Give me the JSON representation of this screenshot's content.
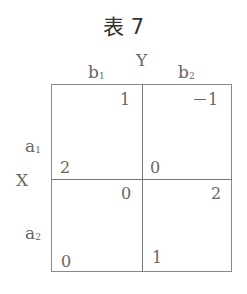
{
  "title": "表 7",
  "column_player": "Y",
  "row_player": "X",
  "columns": [
    {
      "label": "b",
      "sub": "1"
    },
    {
      "label": "b",
      "sub": "2"
    }
  ],
  "rows": [
    {
      "label": "a",
      "sub": "1"
    },
    {
      "label": "a",
      "sub": "2"
    }
  ],
  "payoffs": [
    [
      {
        "y": "1",
        "x": "2"
      },
      {
        "y": "－1",
        "x": "0"
      }
    ],
    [
      {
        "y": "0",
        "x": "0"
      },
      {
        "y": "2",
        "x": "1"
      }
    ]
  ]
}
